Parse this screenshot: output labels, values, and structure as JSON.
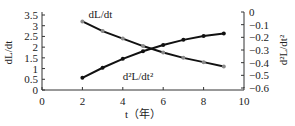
{
  "chart_data": {
    "type": "line",
    "title": "",
    "xlabel": "t（年）",
    "ylabel": "dL/dt",
    "ylabel_right": "d²L/dt²",
    "xlim": [
      0,
      10
    ],
    "ylim": [
      0,
      3.5
    ],
    "ylim_right": [
      -0.6,
      0
    ],
    "x_ticks": [
      "0",
      "2",
      "4",
      "6",
      "8",
      "10"
    ],
    "y_ticks": [
      "0",
      "0.5",
      "1",
      "1.5",
      "2",
      "2.5",
      "3",
      "3.5"
    ],
    "y_ticks_right": [
      "0",
      "−0.1",
      "−0.2",
      "−0.3",
      "−0.4",
      "−0.5",
      "−0.6"
    ],
    "grid": false,
    "legend": "inline annotations",
    "x": [
      2,
      3,
      4,
      5,
      6,
      7,
      8,
      9
    ],
    "series": [
      {
        "name": "dL/dt",
        "axis": "left",
        "marker_color": "#8a8a8a",
        "values": [
          3.2,
          2.75,
          2.4,
          2.05,
          1.75,
          1.5,
          1.3,
          1.1
        ]
      },
      {
        "name": "d²L/dt²",
        "axis": "right",
        "marker_color": "#111111",
        "values": [
          -0.52,
          -0.44,
          -0.37,
          -0.31,
          -0.26,
          -0.22,
          -0.19,
          -0.17
        ]
      }
    ],
    "annotations": [
      {
        "text": "dL/dt",
        "x": 2.3,
        "y": 3.35
      },
      {
        "text": "d²L/dt²",
        "x": 4.0,
        "y": 0.45
      }
    ]
  }
}
